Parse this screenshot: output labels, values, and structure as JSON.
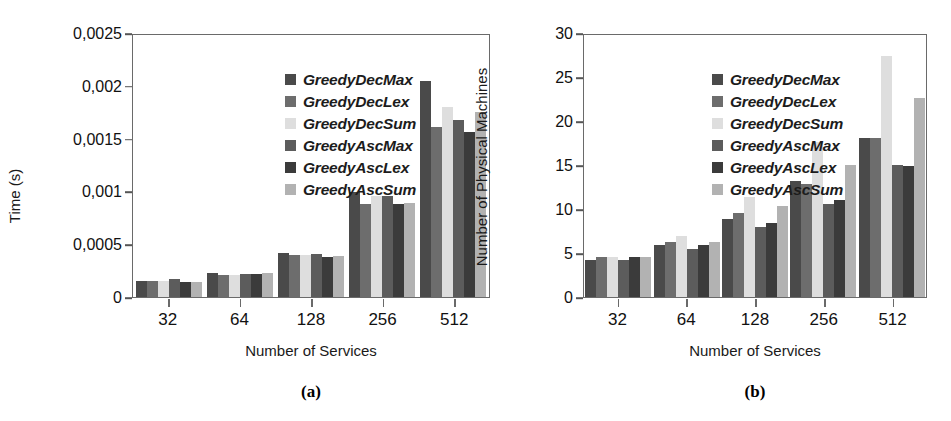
{
  "figure": {
    "series_names": [
      "GreedyDecMax",
      "GreedyDecLex",
      "GreedyDecSum",
      "GreedyAscMax",
      "GreedyAscLex",
      "GreedyAscSum"
    ],
    "series_colors": [
      "#4a4a4a",
      "#6d6d6d",
      "#dedede",
      "#5c5c5c",
      "#3b3b3b",
      "#b2b2b2"
    ],
    "panels": [
      {
        "caption": "(a)",
        "chart_data": {
          "type": "bar",
          "title": "",
          "xlabel": "Number of Services",
          "ylabel": "Time (s)",
          "categories": [
            "32",
            "64",
            "128",
            "256",
            "512"
          ],
          "ylim": [
            0,
            0.0025
          ],
          "yticks": [
            0,
            0.0005,
            0.001,
            0.0015,
            0.002,
            0.0025
          ],
          "ytick_labels": [
            "0",
            "0,0005",
            "0,001",
            "0,0015",
            "0,002",
            "0,0025"
          ],
          "grid": false,
          "legend_position": "top-left",
          "series": [
            {
              "name": "GreedyDecMax",
              "values": [
                0.00015,
                0.00023,
                0.00042,
                0.00099,
                0.00205
              ]
            },
            {
              "name": "GreedyDecLex",
              "values": [
                0.00015,
                0.00021,
                0.0004,
                0.00088,
                0.00161
              ]
            },
            {
              "name": "GreedyDecSum",
              "values": [
                0.00015,
                0.00021,
                0.0004,
                0.00096,
                0.0018
              ]
            },
            {
              "name": "GreedyAscMax",
              "values": [
                0.00017,
                0.00022,
                0.00041,
                0.00096,
                0.00168
              ]
            },
            {
              "name": "GreedyAscLex",
              "values": [
                0.00014,
                0.00022,
                0.00038,
                0.00088,
                0.00156
              ]
            },
            {
              "name": "GreedyAscSum",
              "values": [
                0.00014,
                0.00023,
                0.00039,
                0.00089,
                0.00175
              ]
            }
          ]
        }
      },
      {
        "caption": "(b)",
        "chart_data": {
          "type": "bar",
          "title": "",
          "xlabel": "Number of Services",
          "ylabel": "Number of Physical Machines",
          "categories": [
            "32",
            "64",
            "128",
            "256",
            "512"
          ],
          "ylim": [
            0,
            30
          ],
          "yticks": [
            0,
            5,
            10,
            15,
            20,
            25,
            30
          ],
          "ytick_labels": [
            "0",
            "5",
            "10",
            "15",
            "20",
            "25",
            "30"
          ],
          "grid": false,
          "legend_position": "top-left",
          "series": [
            {
              "name": "GreedyDecMax",
              "values": [
                4.2,
                5.9,
                8.9,
                13.2,
                18.1
              ]
            },
            {
              "name": "GreedyDecLex",
              "values": [
                4.5,
                6.2,
                9.6,
                12.8,
                18.1
              ]
            },
            {
              "name": "GreedyDecSum",
              "values": [
                4.5,
                6.9,
                11.4,
                17.6,
                27.4
              ]
            },
            {
              "name": "GreedyAscMax",
              "values": [
                4.2,
                5.5,
                7.9,
                10.6,
                15.0
              ]
            },
            {
              "name": "GreedyAscLex",
              "values": [
                4.5,
                5.9,
                8.4,
                11.0,
                14.9
              ]
            },
            {
              "name": "GreedyAscSum",
              "values": [
                4.6,
                6.2,
                10.3,
                15.0,
                22.6
              ]
            }
          ]
        }
      }
    ]
  }
}
